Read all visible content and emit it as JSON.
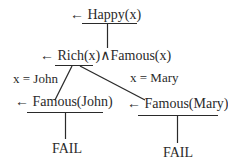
{
  "diagram": {
    "type": "SLD resolution tree",
    "nodes": [
      {
        "id": "root",
        "label": "← Happy(x)"
      },
      {
        "id": "goal2",
        "label": "← Rich(x)∧Famous(x)"
      },
      {
        "id": "john",
        "label": "← Famous(John)"
      },
      {
        "id": "mary",
        "label": "← Famous(Mary)"
      },
      {
        "id": "fail1",
        "label": "FAIL"
      },
      {
        "id": "fail2",
        "label": "FAIL"
      }
    ],
    "edges": [
      {
        "from": "root",
        "to": "goal2",
        "label": ""
      },
      {
        "from": "goal2",
        "to": "john",
        "label": "x = John"
      },
      {
        "from": "goal2",
        "to": "mary",
        "label": "x = Mary"
      },
      {
        "from": "john",
        "to": "fail1",
        "label": ""
      },
      {
        "from": "mary",
        "to": "fail2",
        "label": ""
      }
    ],
    "stroke_color": "#2a2a2a"
  }
}
